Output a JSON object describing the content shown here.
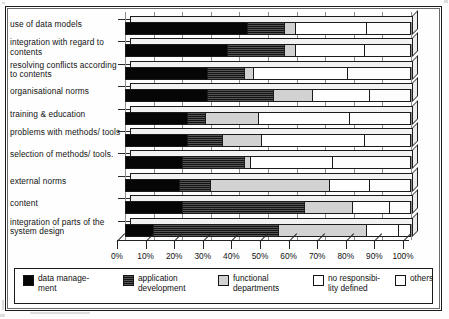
{
  "chart_data": {
    "type": "bar",
    "orientation": "horizontal",
    "stacked": true,
    "style": "3d-stacked-horizontal-bar",
    "title": "",
    "subtitle": "",
    "xlabel": "",
    "ylabel": "",
    "xlim": [
      0,
      100
    ],
    "xunit": "%",
    "grid": true,
    "legend_position": "bottom",
    "xticks": [
      "0%",
      "10%",
      "20%",
      "30%",
      "40%",
      "50%",
      "60%",
      "70%",
      "80%",
      "90%",
      "100%"
    ],
    "xtick_values": [
      0,
      10,
      20,
      30,
      40,
      50,
      60,
      70,
      80,
      90,
      100
    ],
    "categories": [
      "use of data models",
      "integration with regard to contents",
      "resolving conflicts according to contents",
      "organisational norms",
      "training & education",
      "problems with methods/ tools",
      "selection of methods/ tools.",
      "external norms",
      "content",
      "integration of parts of the system design"
    ],
    "series": [
      {
        "name": "data management",
        "values": [
          43,
          36,
          29,
          29,
          22,
          22,
          20,
          19,
          20,
          10
        ]
      },
      {
        "name": "application development",
        "values": [
          13,
          20,
          13,
          23,
          6,
          12,
          22,
          11,
          43,
          44
        ]
      },
      {
        "name": "functional departments",
        "values": [
          4,
          4,
          3,
          14,
          19,
          14,
          2,
          42,
          17,
          31
        ]
      },
      {
        "name": "no responsibility defined",
        "values": [
          25,
          24,
          33,
          20,
          32,
          36,
          29,
          14,
          13,
          11
        ]
      },
      {
        "name": "others",
        "values": [
          15,
          16,
          22,
          14,
          21,
          16,
          27,
          14,
          7,
          4
        ]
      }
    ]
  },
  "legend": {
    "items": [
      {
        "label": "data manage-\nment",
        "color": "#060606",
        "swatch": "solid-black"
      },
      {
        "label": "application\ndevelopment",
        "color": "#2e2e2e",
        "swatch": "dark-hatch"
      },
      {
        "label": "functional\ndepartments",
        "color": "#d2d2d2",
        "swatch": "light-gray"
      },
      {
        "label": "no responsibi-\nlity defined",
        "color": "#ffffff",
        "swatch": "white"
      },
      {
        "label": "others",
        "color": "#fdfdfd",
        "swatch": "white"
      }
    ]
  }
}
